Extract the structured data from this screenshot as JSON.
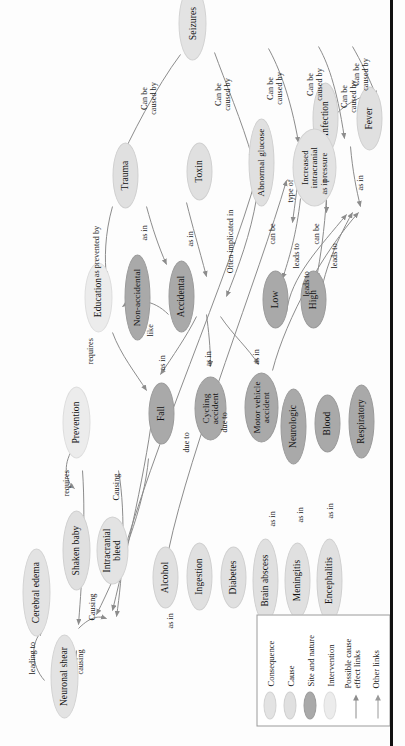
{
  "figure": {
    "type": "concept-map",
    "title_visible": false,
    "orientation": "rotated-90-ccw",
    "page_rule_visible": true
  },
  "legend": {
    "items": [
      {
        "label": "Consequence",
        "swatch": "oval",
        "color": "#e3e3e3"
      },
      {
        "label": "Cause",
        "swatch": "oval",
        "color": "#e0e0e0"
      },
      {
        "label": "Site and nature",
        "swatch": "oval",
        "color": "#a9a9a9"
      },
      {
        "label": "Intervention",
        "swatch": "oval",
        "color": "#ececec"
      },
      {
        "label": "Possible cause effect links",
        "swatch": "arrow",
        "color": "#8a8a8a"
      },
      {
        "label": "Other links",
        "swatch": "arrow",
        "color": "#9a9a9a"
      }
    ]
  },
  "nodes": [
    {
      "id": "neuronal_shear",
      "label": "Neuronal shear",
      "kind": "consequence"
    },
    {
      "id": "cerebral_edema",
      "label": "Cerebral edema",
      "kind": "consequence"
    },
    {
      "id": "shaken_baby",
      "label": "Shaken baby",
      "kind": "cause"
    },
    {
      "id": "intracranial_bleed",
      "label": "Intracranial bleed",
      "kind": "consequence"
    },
    {
      "id": "alcohol",
      "label": "Alcohol",
      "kind": "cause"
    },
    {
      "id": "ingestion",
      "label": "Ingestion",
      "kind": "cause"
    },
    {
      "id": "diabetes",
      "label": "Diabetes",
      "kind": "cause"
    },
    {
      "id": "brain_abscess",
      "label": "Brain abscess",
      "kind": "cause"
    },
    {
      "id": "meningitis",
      "label": "Meningitis",
      "kind": "cause"
    },
    {
      "id": "encephalitis",
      "label": "Encephalitis",
      "kind": "cause"
    },
    {
      "id": "prevention",
      "label": "Prevention",
      "kind": "intervention"
    },
    {
      "id": "fall",
      "label": "Fall",
      "kind": "site"
    },
    {
      "id": "cycling_accident",
      "label": "Cycling accident",
      "kind": "site"
    },
    {
      "id": "motor_vehicle",
      "label": "Motor vehicle accident",
      "kind": "site"
    },
    {
      "id": "neurologic",
      "label": "Neurologic",
      "kind": "site"
    },
    {
      "id": "blood",
      "label": "Blood",
      "kind": "site"
    },
    {
      "id": "respiratory",
      "label": "Respiratory",
      "kind": "site"
    },
    {
      "id": "education",
      "label": "Education",
      "kind": "intervention"
    },
    {
      "id": "non_accidental",
      "label": "Non-accidental",
      "kind": "site"
    },
    {
      "id": "accidental",
      "label": "Accidental",
      "kind": "site"
    },
    {
      "id": "low",
      "label": "Low",
      "kind": "site"
    },
    {
      "id": "high",
      "label": "High",
      "kind": "site"
    },
    {
      "id": "infection",
      "label": "Infection",
      "kind": "cause"
    },
    {
      "id": "trauma",
      "label": "Trauma",
      "kind": "cause"
    },
    {
      "id": "toxin",
      "label": "Toxin",
      "kind": "cause"
    },
    {
      "id": "abnormal_glucose",
      "label": "Abnormal glucose",
      "kind": "cause"
    },
    {
      "id": "increased_icp",
      "label": "Increased intracranial pressure",
      "kind": "consequence"
    },
    {
      "id": "fever",
      "label": "Fever",
      "kind": "cause"
    },
    {
      "id": "seizures",
      "label": "Seizures",
      "kind": "consequence"
    }
  ],
  "edges": [
    {
      "from": "shaken_baby",
      "to": "neuronal_shear",
      "label": "causing"
    },
    {
      "from": "neuronal_shear",
      "to": "cerebral_edema",
      "label": "leading to"
    },
    {
      "from": "shaken_baby",
      "to": "intracranial_bleed",
      "label": "Causing"
    },
    {
      "from": "alcohol",
      "to": "ingestion",
      "label": "as in"
    },
    {
      "from": "prevention",
      "to": "shaken_baby",
      "label": "requires"
    },
    {
      "from": "fall",
      "to": "intracranial_bleed",
      "label": "Causing"
    },
    {
      "from": "accidental",
      "to": "fall",
      "label": "as in"
    },
    {
      "from": "accidental",
      "to": "cycling_accident",
      "label": "as in"
    },
    {
      "from": "accidental",
      "to": "motor_vehicle",
      "label": "as in"
    },
    {
      "from": "education",
      "to": "prevention",
      "label": "requires"
    },
    {
      "from": "education",
      "to": "non_accidental",
      "label": "like"
    },
    {
      "from": "trauma",
      "to": "education",
      "label": "as prevented by"
    },
    {
      "from": "trauma",
      "to": "non_accidental",
      "label": "as in"
    },
    {
      "from": "trauma",
      "to": "accidental",
      "label": "as in"
    },
    {
      "from": "toxin",
      "to": "accidental",
      "label": "Often implicated in"
    },
    {
      "from": "abnormal_glucose",
      "to": "low",
      "label": "can be"
    },
    {
      "from": "abnormal_glucose",
      "to": "high",
      "label": "can be"
    },
    {
      "from": "low",
      "to": "increased_icp",
      "label": "leads to"
    },
    {
      "from": "high",
      "to": "increased_icp",
      "label": "leads to"
    },
    {
      "from": "motor_vehicle",
      "to": "increased_icp",
      "label": "leads to"
    },
    {
      "from": "brain_abscess",
      "to": "neurologic",
      "label": "as in"
    },
    {
      "from": "meningitis",
      "to": "neurologic",
      "label": "as in"
    },
    {
      "from": "encephalitis",
      "to": "neurologic",
      "label": "as in"
    },
    {
      "from": "infection",
      "to": "neurologic",
      "label": "type of"
    },
    {
      "from": "infection",
      "to": "blood",
      "label": "as in"
    },
    {
      "from": "infection",
      "to": "respiratory",
      "label": "as in"
    },
    {
      "from": "infection",
      "to": "fever",
      "label": "Can be caused by"
    },
    {
      "from": "diabetes",
      "to": "abnormal_glucose",
      "label": "due to"
    },
    {
      "from": "ingestion",
      "to": "toxin",
      "label": "due to"
    },
    {
      "from": "seizures",
      "to": "trauma",
      "label": "Can be caused by"
    },
    {
      "from": "seizures",
      "to": "toxin",
      "label": "Can be caused by"
    },
    {
      "from": "seizures",
      "to": "abnormal_glucose",
      "label": "Can be caused by"
    },
    {
      "from": "seizures",
      "to": "increased_icp",
      "label": "Can be caused by"
    },
    {
      "from": "seizures",
      "to": "fever",
      "label": "Can be caused by"
    }
  ],
  "colors": {
    "consequence": "#e3e3e3",
    "cause": "#e0e0e0",
    "site": "#a9a9a9",
    "intervention": "#ececec",
    "edge": "#8c8c8c",
    "text": "#111111",
    "page_rule": "#111111"
  }
}
